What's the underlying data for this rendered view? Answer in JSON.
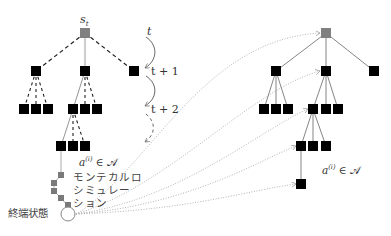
{
  "diagram": {
    "colors": {
      "node": "#000000",
      "root_node": "#808080",
      "sim_node": "#7a7a7a",
      "solid_edge": "#777777",
      "highlight_edge": "#c8c8c8",
      "dotted_edge": "#aaaaaa",
      "text": "#333333"
    },
    "left_tree": {
      "root_label": "s",
      "root_label_sub": "t",
      "action_label_prefix": "a",
      "action_label_sup": "(i)",
      "action_label_suffix": " ∈ 𝒜",
      "simulation_label_lines": [
        "モンテカルロ",
        "シミュレー",
        "ション"
      ],
      "terminal_label": "終端状態"
    },
    "time_steps": [
      "t",
      "t + 1",
      "t + 2"
    ],
    "right_tree": {
      "action_label_prefix": "a",
      "action_label_sup": "(i)",
      "action_label_suffix": " ∈ 𝒜"
    }
  }
}
